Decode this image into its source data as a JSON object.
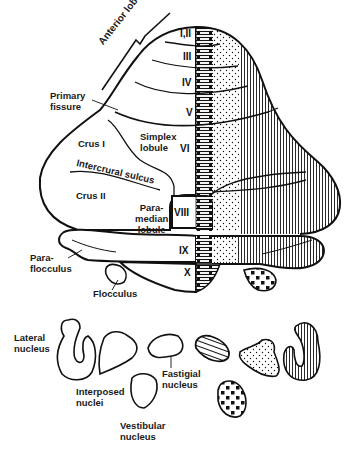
{
  "figure": {
    "type": "cerebellum-diagram"
  },
  "lobules": {
    "l1_2": "I,II",
    "l3": "III",
    "l4": "IV",
    "l5": "V",
    "l6": "VI",
    "l8": "VIII",
    "l9": "IX",
    "l10": "X"
  },
  "labels": {
    "anterior_lobe": "Anterior lobe",
    "primary_fissure_1": "Primary",
    "primary_fissure_2": "fissure",
    "simplex_1": "Simplex",
    "simplex_2": "lobule",
    "crus1": "Crus I",
    "intercrural": "Intercrural sulcus",
    "crus2": "Crus II",
    "paramedian_1": "Para-",
    "paramedian_2": "median",
    "paramedian_3": "lobule",
    "paraflocculus_1": "Para-",
    "paraflocculus_2": "flocculus",
    "flocculus": "Flocculus",
    "lateral_1": "Lateral",
    "lateral_2": "nucleus",
    "interposed_1": "Interposed",
    "interposed_2": "nuclei",
    "fastigial_1": "Fastigial",
    "fastigial_2": "nucleus",
    "vestibular_1": "Vestibular",
    "vestibular_2": "nucleus"
  },
  "zones": [
    {
      "name": "vermis-medial",
      "pattern": "horizontal-lines",
      "nucleus": "Fastigial nucleus"
    },
    {
      "name": "intermediate",
      "pattern": "dots",
      "nucleus": "Interposed nuclei"
    },
    {
      "name": "lateral-hemisphere",
      "pattern": "vertical-lines",
      "nucleus": "Lateral nucleus"
    },
    {
      "name": "flocculonodular",
      "pattern": "large-squares",
      "nucleus": "Vestibular nucleus"
    }
  ],
  "colors": {
    "ink": "#111111",
    "paper": "#ffffff"
  }
}
